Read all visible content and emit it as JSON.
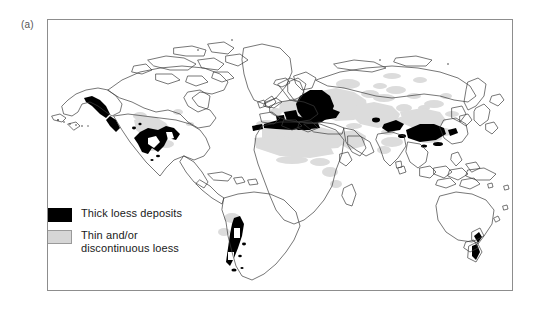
{
  "figure": {
    "panel_label": "(a)",
    "caption_text": ""
  },
  "legend": {
    "items": [
      {
        "swatch": "black-filled-rectangle",
        "swatch_color": "#000000",
        "label_line1": "Thick loess deposits",
        "label_line2": ""
      },
      {
        "swatch": "gray-filled-rectangle",
        "swatch_color": "#d6d6d6",
        "label_line1": "Thin and/or",
        "label_line2": "discontinuous loess"
      }
    ]
  },
  "map": {
    "title": "",
    "projection_note": "",
    "frame_color": "#8d8d8d",
    "coastline_color": "#3a3a3a",
    "thick_loess_color": "#000000",
    "thin_loess_color": "#d8d8d8",
    "ocean_color": "#ffffff",
    "land_color": "#ffffff",
    "regions_thick": [
      "North American Midwest",
      "Alaska coastal",
      "Eastern Europe and Ukraine",
      "Central Asia",
      "Chinese Loess Plateau",
      "North Africa coastal",
      "Argentine Pampas and Patagonia",
      "New Zealand"
    ],
    "regions_thin": [
      "Western Europe",
      "Sahara and Sahel",
      "Middle East",
      "Siberia and Central Asia",
      "Northern China and Mongolia",
      "Northern India"
    ]
  }
}
